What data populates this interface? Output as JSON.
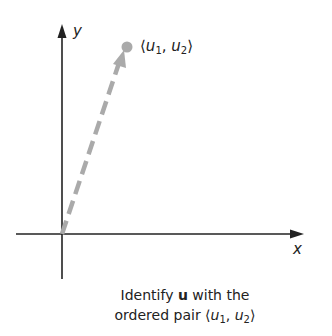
{
  "diagram": {
    "axes": {
      "x_label": "x",
      "y_label": "y"
    },
    "vector": {
      "name": "u",
      "tip_label": "⟨u₁, u₂⟩",
      "tip_label_parts": {
        "open": "⟨",
        "u1": "u",
        "sub1": "1",
        "comma": ", ",
        "u2": "u",
        "sub2": "2",
        "close": "⟩"
      },
      "color": "#aaaaaa",
      "style": "dashed"
    },
    "caption": {
      "line1_pre": "Identify ",
      "line1_bold": "u",
      "line1_post": " with the",
      "line2_pre": "ordered pair ",
      "pair": {
        "open": "⟨",
        "u1": "u",
        "sub1": "1",
        "comma": ", ",
        "u2": "u",
        "sub2": "2",
        "close": "⟩"
      }
    }
  }
}
